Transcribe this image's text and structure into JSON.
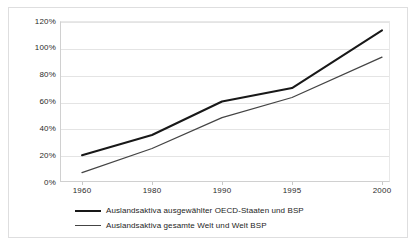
{
  "chart_data": {
    "type": "line",
    "title": "",
    "subtitle": "",
    "xlabel": "",
    "ylabel": "",
    "categories": [
      "1960",
      "1980",
      "1990",
      "1995",
      "2000"
    ],
    "x_tick_labels": [
      "1960",
      "1980",
      "1990",
      "1995",
      "2000"
    ],
    "y_tick_labels": [
      "0%",
      "20%",
      "40%",
      "60%",
      "80%",
      "100%",
      "120%"
    ],
    "y_tick_values": [
      0,
      20,
      40,
      60,
      80,
      100,
      120
    ],
    "ylim": [
      0,
      120
    ],
    "grid": "horizontal",
    "legend_position": "bottom-left",
    "series": [
      {
        "name": "Auslandsaktiva ausgewählter OECD-Staaten und BSP",
        "values": [
          20,
          35,
          60,
          70,
          113
        ],
        "color": "#181818",
        "line_width": 2
      },
      {
        "name": "Auslandsaktiva gesamte Welt und Welt BSP",
        "values": [
          7,
          25,
          48,
          63,
          93
        ],
        "color": "#444444",
        "line_width": 1
      }
    ],
    "annotations": []
  },
  "legend": {
    "entries": [
      {
        "label": "Auslandsaktiva ausgewählter OECD-Staaten und BSP"
      },
      {
        "label": "Auslandsaktiva gesamte Welt und Welt BSP"
      }
    ]
  },
  "colors": {
    "series_oecd": "#181818",
    "series_world": "#444444",
    "gridline": "#e4e4e4",
    "axis": "#d0d0d0",
    "frame": "#dededf",
    "text": "#2b2b2b",
    "background": "#ffffff"
  }
}
